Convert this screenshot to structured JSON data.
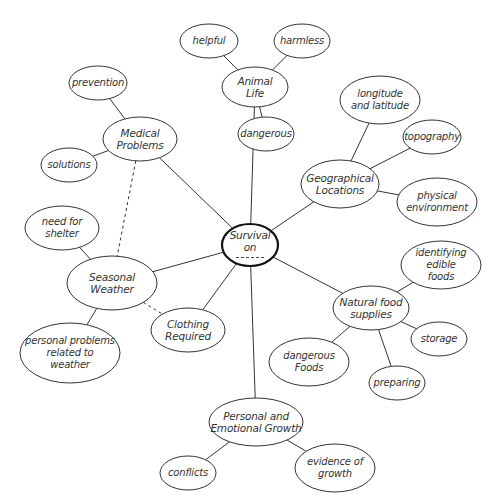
{
  "diagram": {
    "type": "web-organizer",
    "colors": {
      "background": "#ffffff",
      "stroke": "#333333",
      "text": "#333333",
      "center_stroke": "#111111"
    },
    "center": {
      "id": "survival",
      "label": "Survival\non",
      "blank": "------",
      "x": 250,
      "y": 245,
      "rx": 28,
      "ry": 21
    },
    "nodes": [
      {
        "id": "animal-life",
        "label": "Animal\nLife",
        "x": 255,
        "y": 87,
        "rx": 33,
        "ry": 20,
        "level": 1
      },
      {
        "id": "helpful",
        "label": "helpful",
        "x": 209,
        "y": 41,
        "rx": 29,
        "ry": 17,
        "level": 2
      },
      {
        "id": "harmless",
        "label": "harmless",
        "x": 302,
        "y": 41,
        "rx": 28,
        "ry": 17,
        "level": 2
      },
      {
        "id": "dangerous",
        "label": "dangerous",
        "x": 266,
        "y": 134,
        "rx": 28,
        "ry": 17,
        "level": 2
      },
      {
        "id": "medical-problems",
        "label": "Medical\nProblems",
        "x": 140,
        "y": 139,
        "rx": 37,
        "ry": 22,
        "level": 1
      },
      {
        "id": "prevention",
        "label": "prevention",
        "x": 98,
        "y": 83,
        "rx": 29,
        "ry": 17,
        "level": 2
      },
      {
        "id": "solutions",
        "label": "solutions",
        "x": 69,
        "y": 165,
        "rx": 28,
        "ry": 17,
        "level": 2
      },
      {
        "id": "geographical-locations",
        "label": "Geographical\nLocations",
        "x": 340,
        "y": 184,
        "rx": 39,
        "ry": 24,
        "level": 1
      },
      {
        "id": "longitude-latitude",
        "label": "longitude\nand latitude",
        "x": 380,
        "y": 100,
        "rx": 40,
        "ry": 24,
        "level": 2
      },
      {
        "id": "topography",
        "label": "topography",
        "x": 432,
        "y": 137,
        "rx": 29,
        "ry": 17,
        "level": 2
      },
      {
        "id": "physical-environment",
        "label": "physical\nenvironment",
        "x": 437,
        "y": 202,
        "rx": 40,
        "ry": 24,
        "level": 2
      },
      {
        "id": "seasonal-weather",
        "label": "Seasonal\nWeather",
        "x": 112,
        "y": 283,
        "rx": 45,
        "ry": 27,
        "level": 1
      },
      {
        "id": "need-for-shelter",
        "label": "need for\nshelter",
        "x": 62,
        "y": 228,
        "rx": 37,
        "ry": 22,
        "level": 2
      },
      {
        "id": "personal-problems-weather",
        "label": "personal problems\nrelated to\nweather",
        "x": 70,
        "y": 353,
        "rx": 50,
        "ry": 30,
        "level": 2
      },
      {
        "id": "clothing-required",
        "label": "Clothing\nRequired",
        "x": 188,
        "y": 330,
        "rx": 37,
        "ry": 22,
        "level": 1
      },
      {
        "id": "natural-food-supplies",
        "label": "Natural food\nsupplies",
        "x": 371,
        "y": 308,
        "rx": 38,
        "ry": 22,
        "level": 1
      },
      {
        "id": "identifying-edible-foods",
        "label": "identifying\nedible foods",
        "x": 441,
        "y": 265,
        "rx": 40,
        "ry": 24,
        "level": 2
      },
      {
        "id": "storage",
        "label": "storage",
        "x": 439,
        "y": 339,
        "rx": 28,
        "ry": 17,
        "level": 2
      },
      {
        "id": "preparing",
        "label": "preparing",
        "x": 397,
        "y": 383,
        "rx": 28,
        "ry": 17,
        "level": 2
      },
      {
        "id": "dangerous-foods",
        "label": "dangerous\nFoods",
        "x": 309,
        "y": 362,
        "rx": 40,
        "ry": 24,
        "level": 2
      },
      {
        "id": "personal-emotional-growth",
        "label": "Personal and\nEmotional Growth",
        "x": 256,
        "y": 422,
        "rx": 47,
        "ry": 24,
        "level": 1
      },
      {
        "id": "conflicts",
        "label": "conflicts",
        "x": 188,
        "y": 473,
        "rx": 28,
        "ry": 17,
        "level": 2
      },
      {
        "id": "evidence-of-growth",
        "label": "evidence of\ngrowth",
        "x": 335,
        "y": 468,
        "rx": 40,
        "ry": 24,
        "level": 2
      }
    ],
    "edges": [
      {
        "from": "survival",
        "to": "animal-life",
        "style": "solid"
      },
      {
        "from": "survival",
        "to": "medical-problems",
        "style": "solid"
      },
      {
        "from": "survival",
        "to": "geographical-locations",
        "style": "solid"
      },
      {
        "from": "survival",
        "to": "seasonal-weather",
        "style": "solid"
      },
      {
        "from": "survival",
        "to": "clothing-required",
        "style": "solid"
      },
      {
        "from": "survival",
        "to": "natural-food-supplies",
        "style": "solid"
      },
      {
        "from": "survival",
        "to": "personal-emotional-growth",
        "style": "solid"
      },
      {
        "from": "animal-life",
        "to": "helpful",
        "style": "solid"
      },
      {
        "from": "animal-life",
        "to": "harmless",
        "style": "solid"
      },
      {
        "from": "animal-life",
        "to": "dangerous",
        "style": "solid"
      },
      {
        "from": "medical-problems",
        "to": "prevention",
        "style": "solid"
      },
      {
        "from": "medical-problems",
        "to": "solutions",
        "style": "solid"
      },
      {
        "from": "medical-problems",
        "to": "seasonal-weather",
        "style": "dashed"
      },
      {
        "from": "geographical-locations",
        "to": "longitude-latitude",
        "style": "solid"
      },
      {
        "from": "geographical-locations",
        "to": "topography",
        "style": "solid"
      },
      {
        "from": "geographical-locations",
        "to": "physical-environment",
        "style": "solid"
      },
      {
        "from": "seasonal-weather",
        "to": "need-for-shelter",
        "style": "solid"
      },
      {
        "from": "seasonal-weather",
        "to": "personal-problems-weather",
        "style": "solid"
      },
      {
        "from": "seasonal-weather",
        "to": "clothing-required",
        "style": "dashed"
      },
      {
        "from": "natural-food-supplies",
        "to": "identifying-edible-foods",
        "style": "solid"
      },
      {
        "from": "natural-food-supplies",
        "to": "storage",
        "style": "solid"
      },
      {
        "from": "natural-food-supplies",
        "to": "preparing",
        "style": "solid"
      },
      {
        "from": "natural-food-supplies",
        "to": "dangerous-foods",
        "style": "solid"
      },
      {
        "from": "personal-emotional-growth",
        "to": "conflicts",
        "style": "solid"
      },
      {
        "from": "personal-emotional-growth",
        "to": "evidence-of-growth",
        "style": "solid"
      }
    ]
  }
}
